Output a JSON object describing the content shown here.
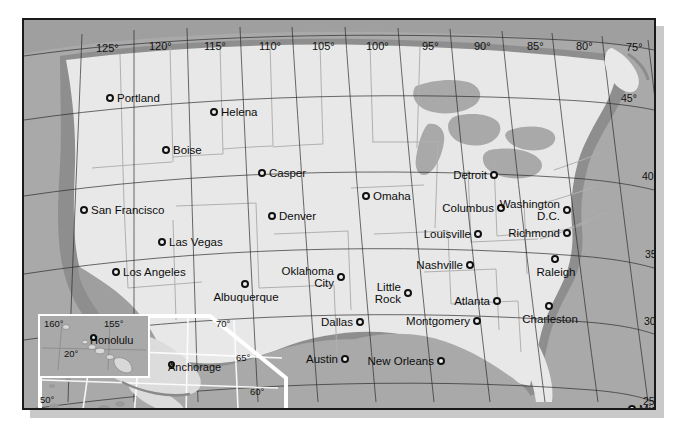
{
  "map": {
    "title": "United States reference map",
    "projection_note": "conic",
    "colors": {
      "ocean": "#a9a9a9",
      "land": "#e6e6e6",
      "coast_halo": "#8a8a8a",
      "state_border": "#9a9a9a",
      "frame": "#1a1a1a",
      "inset_outline": "#ffffff",
      "shadow": "#c9c9c9",
      "label": "#0d0d0d"
    },
    "longitude_labels": [
      {
        "text": "125°",
        "x": 72,
        "y": 22
      },
      {
        "text": "120°",
        "x": 125,
        "y": 20
      },
      {
        "text": "115°",
        "x": 180,
        "y": 20
      },
      {
        "text": "110°",
        "x": 235,
        "y": 20
      },
      {
        "text": "105°",
        "x": 288,
        "y": 20
      },
      {
        "text": "100°",
        "x": 342,
        "y": 20
      },
      {
        "text": "95°",
        "x": 398,
        "y": 20
      },
      {
        "text": "90°",
        "x": 450,
        "y": 20
      },
      {
        "text": "85°",
        "x": 503,
        "y": 20
      },
      {
        "text": "80°",
        "x": 552,
        "y": 20
      },
      {
        "text": "75°",
        "x": 602,
        "y": 21
      },
      {
        "text": "70°",
        "x": 648,
        "y": 22
      },
      {
        "text": "65°",
        "x": 696,
        "y": 23
      }
    ],
    "latitude_labels": [
      {
        "text": "45°",
        "x": 597,
        "y": 72
      },
      {
        "text": "40°",
        "x": 618,
        "y": 150
      },
      {
        "text": "35°",
        "x": 621,
        "y": 228
      },
      {
        "text": "30°",
        "x": 620,
        "y": 295
      },
      {
        "text": "25°",
        "x": 619,
        "y": 375
      }
    ],
    "cities": [
      {
        "name": "Portland",
        "x": 82,
        "y": 78,
        "side": "right"
      },
      {
        "name": "Helena",
        "x": 186,
        "y": 92,
        "side": "right"
      },
      {
        "name": "Boise",
        "x": 138,
        "y": 130,
        "side": "right"
      },
      {
        "name": "Casper",
        "x": 234,
        "y": 153,
        "side": "right"
      },
      {
        "name": "San Francisco",
        "x": 56,
        "y": 190,
        "side": "right"
      },
      {
        "name": "Denver",
        "x": 244,
        "y": 196,
        "side": "right"
      },
      {
        "name": "Omaha",
        "x": 338,
        "y": 176,
        "side": "right"
      },
      {
        "name": "Detroit",
        "x": 468,
        "y": 155,
        "side": "left"
      },
      {
        "name": "Las Vegas",
        "x": 134,
        "y": 222,
        "side": "right"
      },
      {
        "name": "Columbus",
        "x": 475,
        "y": 188,
        "side": "left"
      },
      {
        "name": "Washington D.C.",
        "x": 541,
        "y": 190,
        "side": "left",
        "lines": [
          "Washington",
          "D.C."
        ]
      },
      {
        "name": "Louisville",
        "x": 452,
        "y": 214,
        "side": "left"
      },
      {
        "name": "Richmond",
        "x": 541,
        "y": 213,
        "side": "left"
      },
      {
        "name": "Los Angeles",
        "x": 88,
        "y": 252,
        "side": "right"
      },
      {
        "name": "Nashville",
        "x": 444,
        "y": 245,
        "side": "left"
      },
      {
        "name": "Raleigh",
        "x": 532,
        "y": 240,
        "side": "above"
      },
      {
        "name": "Oklahoma City",
        "x": 315,
        "y": 257,
        "side": "left",
        "lines": [
          "Oklahoma",
          "City"
        ]
      },
      {
        "name": "Little Rock",
        "x": 382,
        "y": 273,
        "side": "left",
        "lines": [
          "Little",
          "Rock"
        ]
      },
      {
        "name": "Albuquerque",
        "x": 222,
        "y": 265,
        "side": "above"
      },
      {
        "name": "Atlanta",
        "x": 471,
        "y": 281,
        "side": "left"
      },
      {
        "name": "Charleston",
        "x": 526,
        "y": 287,
        "side": "above"
      },
      {
        "name": "Dallas",
        "x": 334,
        "y": 302,
        "side": "left"
      },
      {
        "name": "Montgomery",
        "x": 451,
        "y": 301,
        "side": "left"
      },
      {
        "name": "Austin",
        "x": 319,
        "y": 339,
        "side": "left"
      },
      {
        "name": "New Orleans",
        "x": 415,
        "y": 341,
        "side": "left"
      },
      {
        "name": "Miami",
        "x": 604,
        "y": 389,
        "side": "right"
      }
    ],
    "hawaii_inset": {
      "label": "Hawaii inset",
      "cities": [
        {
          "name": "Honolulu",
          "x": 52,
          "y": 26,
          "side": "right"
        }
      ],
      "graticule": [
        {
          "text": "160°",
          "x": 6,
          "y": 4
        },
        {
          "text": "155°",
          "x": 66,
          "y": 4
        },
        {
          "text": "20°",
          "x": 26,
          "y": 34
        }
      ]
    },
    "alaska_inset": {
      "label": "Alaska inset",
      "cities": [
        {
          "name": "Anchorage",
          "x": 170,
          "y": 52,
          "side": "above"
        }
      ],
      "graticule": [
        {
          "text": "70°",
          "x": 178,
          "y": 4
        },
        {
          "text": "65°",
          "x": 198,
          "y": 38
        },
        {
          "text": "60°",
          "x": 212,
          "y": 72
        },
        {
          "text": "50°",
          "x": 2,
          "y": 80
        },
        {
          "text": "180°",
          "x": 22,
          "y": 98
        },
        {
          "text": "170°",
          "x": 78,
          "y": 98
        },
        {
          "text": "160°",
          "x": 124,
          "y": 97
        },
        {
          "text": "150°",
          "x": 166,
          "y": 97
        },
        {
          "text": "140°",
          "x": 212,
          "y": 97
        }
      ]
    }
  }
}
